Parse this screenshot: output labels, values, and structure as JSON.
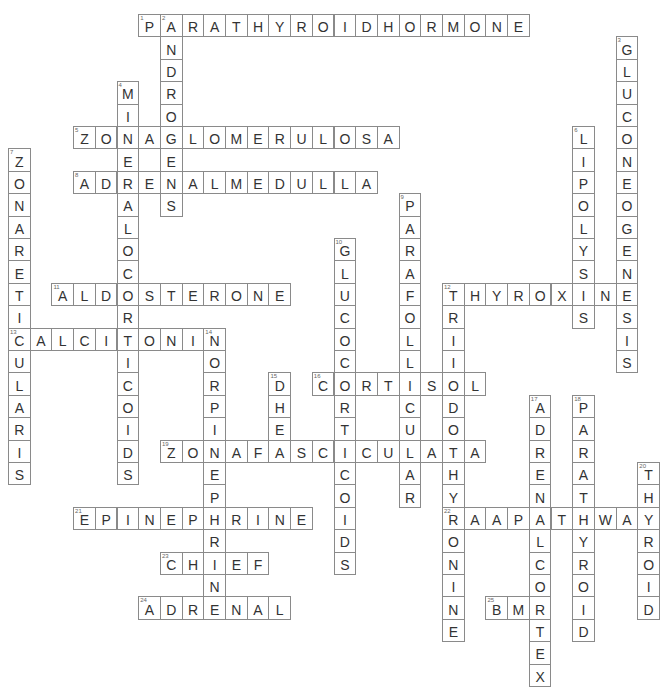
{
  "puzzle": {
    "title_fragment": "",
    "grid": {
      "origin_x": 8,
      "origin_y": 14,
      "cell_w": 21.7,
      "cell_h": 22.4
    },
    "colors": {
      "border": "#8a8a8a",
      "letter": "#333333",
      "number": "#666666",
      "background": "#ffffff"
    },
    "words": [
      {
        "number": 1,
        "direction": "across",
        "row": 0,
        "col": 6,
        "answer": "PARATHYROIDHORMONE"
      },
      {
        "number": 2,
        "direction": "down",
        "row": 0,
        "col": 7,
        "answer": "ANDROGENS"
      },
      {
        "number": 3,
        "direction": "down",
        "row": 1,
        "col": 28,
        "answer": "GLUCONEOGENESIS"
      },
      {
        "number": 4,
        "direction": "down",
        "row": 3,
        "col": 5,
        "answer": "MINERALOCORTICOIDS"
      },
      {
        "number": 5,
        "direction": "across",
        "row": 5,
        "col": 3,
        "answer": "ZONAGLOMERULOSA"
      },
      {
        "number": 6,
        "direction": "down",
        "row": 5,
        "col": 26,
        "answer": "LIPOLYSIS"
      },
      {
        "number": 7,
        "direction": "down",
        "row": 6,
        "col": 0,
        "answer": "ZONARETICULARIS"
      },
      {
        "number": 8,
        "direction": "across",
        "row": 7,
        "col": 3,
        "answer": "ADRENALMEDULLA"
      },
      {
        "number": 9,
        "direction": "down",
        "row": 8,
        "col": 18,
        "answer": "PARAFOLLICULAR"
      },
      {
        "number": 10,
        "direction": "down",
        "row": 10,
        "col": 15,
        "answer": "GLUCOCORTICOIDS"
      },
      {
        "number": 11,
        "direction": "across",
        "row": 12,
        "col": 2,
        "answer": "ALDOSTERONE"
      },
      {
        "number": 12,
        "direction": "across",
        "row": 12,
        "col": 20,
        "answer": "THYROXINE"
      },
      {
        "number": 12,
        "direction": "down",
        "row": 12,
        "col": 20,
        "answer": "TRIIODOTHYRONINE"
      },
      {
        "number": 13,
        "direction": "across",
        "row": 14,
        "col": 0,
        "answer": "CALCITONIN"
      },
      {
        "number": 14,
        "direction": "down",
        "row": 14,
        "col": 9,
        "answer": "NORPINEPHRINE"
      },
      {
        "number": 15,
        "direction": "down",
        "row": 16,
        "col": 12,
        "answer": "DHEA"
      },
      {
        "number": 16,
        "direction": "across",
        "row": 16,
        "col": 14,
        "answer": "CORTISOL"
      },
      {
        "number": 17,
        "direction": "down",
        "row": 17,
        "col": 24,
        "answer": "ADRENALCORTEX"
      },
      {
        "number": 18,
        "direction": "down",
        "row": 17,
        "col": 26,
        "answer": "PARATHYROID"
      },
      {
        "number": 19,
        "direction": "across",
        "row": 19,
        "col": 7,
        "answer": "ZONAFASCICULATA"
      },
      {
        "number": 20,
        "direction": "down",
        "row": 20,
        "col": 29,
        "answer": "THYROID"
      },
      {
        "number": 21,
        "direction": "across",
        "row": 22,
        "col": 3,
        "answer": "EPINEPHRINE"
      },
      {
        "number": 22,
        "direction": "across",
        "row": 22,
        "col": 20,
        "answer": "RAAPATHWAY"
      },
      {
        "number": 23,
        "direction": "across",
        "row": 24,
        "col": 7,
        "answer": "CHIEF"
      },
      {
        "number": 24,
        "direction": "across",
        "row": 26,
        "col": 6,
        "answer": "ADRENAL"
      },
      {
        "number": 25,
        "direction": "across",
        "row": 26,
        "col": 22,
        "answer": "BMR"
      }
    ]
  }
}
